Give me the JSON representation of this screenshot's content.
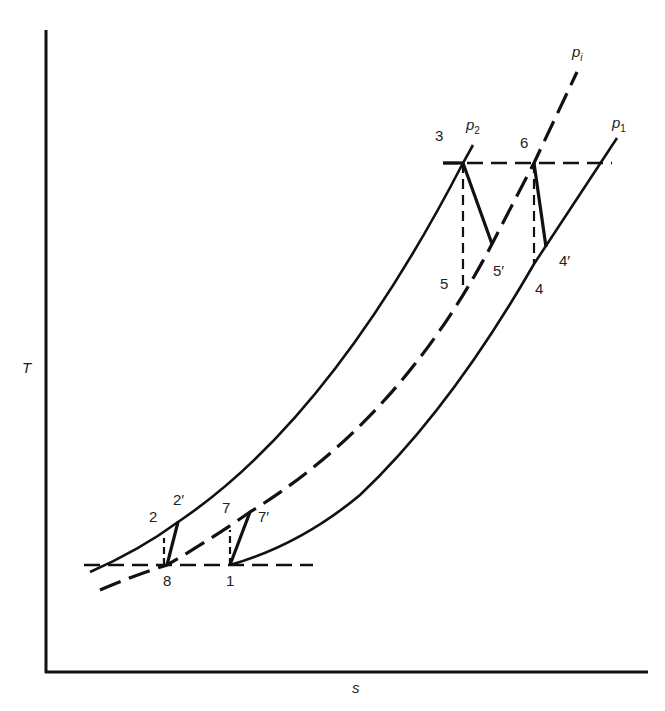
{
  "diagram": {
    "type": "T-s diagram (gas turbine cycle with intercooling and reheat)",
    "axes": {
      "y_label": "T",
      "x_label": "s"
    },
    "curves": [
      {
        "name": "p1",
        "style": "solid",
        "label_main": "p",
        "label_sub": "1"
      },
      {
        "name": "pi",
        "style": "dashed",
        "label_main": "p",
        "label_sub": "i"
      },
      {
        "name": "p2",
        "style": "solid",
        "label_main": "p",
        "label_sub": "2"
      }
    ],
    "points": {
      "p1": "1",
      "p2": "2",
      "p2prime": "2′",
      "p3": "3",
      "p4": "4",
      "p4prime": "4′",
      "p5": "5",
      "p5prime": "5′",
      "p6": "6",
      "p7": "7",
      "p7prime": "7′",
      "p8": "8"
    },
    "colors": {
      "line": "#111111",
      "background": "#ffffff"
    }
  }
}
